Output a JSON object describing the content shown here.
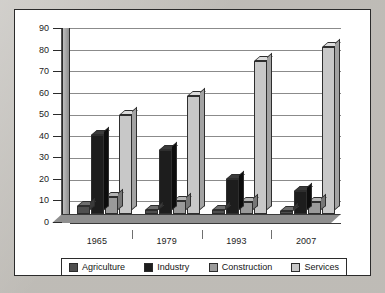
{
  "chart_data": {
    "type": "bar",
    "title": "",
    "subtitle": "",
    "xlabel": "",
    "ylabel": "",
    "ylim": [
      0,
      90
    ],
    "ytick_step": 10,
    "yticks": [
      90,
      80,
      70,
      60,
      50,
      40,
      30,
      20,
      10,
      0
    ],
    "grid": true,
    "legend_position": "bottom",
    "style": "3d-grouped-columns",
    "categories": [
      "1965",
      "1979",
      "1993",
      "2007"
    ],
    "series": [
      {
        "name": "Agriculture",
        "color": "#4f4f4f",
        "values": [
          4,
          2,
          2,
          1.5
        ]
      },
      {
        "name": "Industry",
        "color": "#1d1d1d",
        "values": [
          38,
          31,
          17,
          11
        ]
      },
      {
        "name": "Construction",
        "color": "#9a9a9a",
        "values": [
          8,
          6.5,
          6,
          6
        ]
      },
      {
        "name": "Services",
        "color": "#c8c8c8",
        "values": [
          48,
          57,
          74,
          81
        ]
      }
    ]
  },
  "legend": {
    "items": [
      {
        "label": "Agriculture",
        "swatch_class": "sw-agriculture"
      },
      {
        "label": "Industry",
        "swatch_class": "sw-industry"
      },
      {
        "label": "Construction",
        "swatch_class": "sw-construction"
      },
      {
        "label": "Services",
        "swatch_class": "sw-services"
      }
    ]
  },
  "colors": {
    "page_background": "#cac7c1",
    "card_background": "#ffffff",
    "card_border": "#2b2b2b",
    "gridline": "#8b8b8b",
    "axis": "#2b2b2b",
    "text": "#1c1c1c"
  }
}
